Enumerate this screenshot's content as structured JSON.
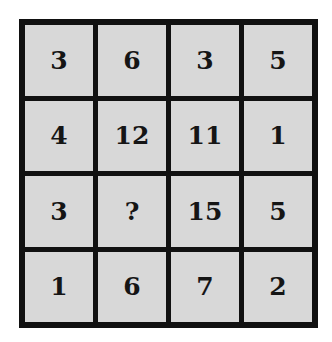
{
  "puzzle": {
    "grid": [
      [
        "3",
        "6",
        "3",
        "5"
      ],
      [
        "4",
        "12",
        "11",
        "1"
      ],
      [
        "3",
        "?",
        "15",
        "5"
      ],
      [
        "1",
        "6",
        "7",
        "2"
      ]
    ],
    "colors": {
      "border": "#111111",
      "cell": "#d8d8d8",
      "text": "#151515",
      "background": "#ffffff"
    }
  }
}
